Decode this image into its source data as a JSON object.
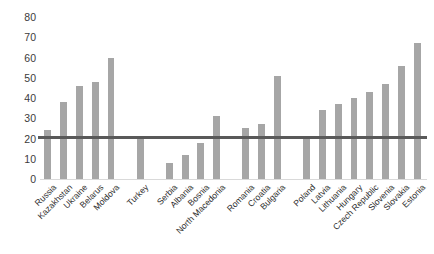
{
  "chart_data": {
    "type": "bar",
    "title": "",
    "subtitle": "",
    "xlabel": "",
    "ylabel": "",
    "ylim": [
      0,
      80
    ],
    "ytick_step": 10,
    "ytick_labels": [
      "0",
      "10",
      "20",
      "30",
      "40",
      "50",
      "60",
      "70",
      "80"
    ],
    "grid": false,
    "legend": false,
    "bar_color": "#a6a6a6",
    "reference_line": {
      "value": 21,
      "color": "#595959",
      "label": ""
    },
    "categories": [
      "Russia",
      "Kazakhstan",
      "Ukraine",
      "Belarus",
      "Moldova",
      "Turkey",
      "Serbia",
      "Albania",
      "Bosnia",
      "North Macedonia",
      "Romania",
      "Croatia",
      "Bulgaria",
      "Poland",
      "Latvia",
      "Lithuania",
      "Hungary",
      "Czech Republic",
      "Slovenia",
      "Slovakia",
      "Estonia"
    ],
    "values": [
      24,
      38,
      46,
      48,
      60,
      20,
      8,
      12,
      18,
      31,
      25,
      27,
      51,
      20,
      34,
      37,
      40,
      43,
      47,
      56,
      67
    ],
    "groups": [
      {
        "name": "group-1",
        "categories": [
          "Russia",
          "Kazakhstan",
          "Ukraine",
          "Belarus",
          "Moldova"
        ]
      },
      {
        "name": "group-2",
        "categories": [
          "Turkey"
        ]
      },
      {
        "name": "group-3",
        "categories": [
          "Serbia",
          "Albania",
          "Bosnia",
          "North Macedonia"
        ]
      },
      {
        "name": "group-4",
        "categories": [
          "Romania",
          "Croatia",
          "Bulgaria"
        ]
      },
      {
        "name": "group-5",
        "categories": [
          "Poland",
          "Latvia",
          "Lithuania",
          "Hungary",
          "Czech Republic",
          "Slovenia",
          "Slovakia",
          "Estonia"
        ]
      }
    ]
  }
}
